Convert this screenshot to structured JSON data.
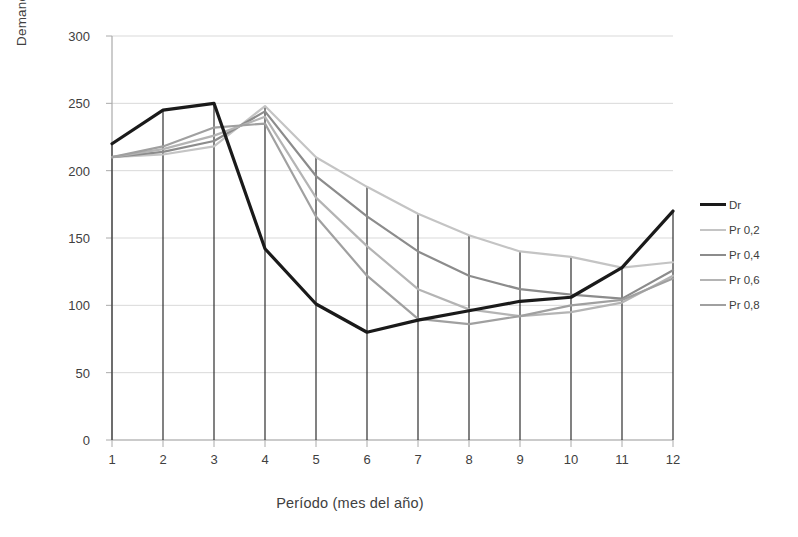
{
  "chart_data": {
    "type": "line",
    "title": "",
    "xlabel": "Período (mes del año)",
    "ylabel": "Demanda",
    "categories": [
      "1",
      "2",
      "3",
      "4",
      "5",
      "6",
      "7",
      "8",
      "9",
      "10",
      "11",
      "12"
    ],
    "x": [
      1,
      2,
      3,
      4,
      5,
      6,
      7,
      8,
      9,
      10,
      11,
      12
    ],
    "xlim": [
      1,
      12
    ],
    "ylim": [
      0,
      300
    ],
    "yticks": [
      "0",
      "50",
      "100",
      "150",
      "200",
      "250",
      "300"
    ],
    "ytick_values": [
      0,
      50,
      100,
      150,
      200,
      250,
      300
    ],
    "grid": "horizontal",
    "legend_position": "right",
    "drop_lines": true,
    "series": [
      {
        "name": "Dr",
        "color": "#1a1a1a",
        "width": 3.2,
        "values": [
          220,
          245,
          250,
          142,
          101,
          80,
          89,
          96,
          103,
          106,
          128,
          170
        ]
      },
      {
        "name": "Pr 0,2",
        "color": "#c4c4c4",
        "width": 2.2,
        "values": [
          210,
          212,
          218,
          248,
          210,
          188,
          168,
          152,
          140,
          136,
          128,
          132
        ]
      },
      {
        "name": "Pr 0,4",
        "color": "#8c8c8c",
        "width": 2.2,
        "values": [
          210,
          214,
          222,
          244,
          196,
          166,
          140,
          122,
          112,
          108,
          105,
          126
        ]
      },
      {
        "name": "Pr 0,6",
        "color": "#b4b4b4",
        "width": 2.2,
        "values": [
          210,
          216,
          226,
          240,
          180,
          144,
          112,
          97,
          92,
          95,
          102,
          122
        ]
      },
      {
        "name": "Pr 0,8",
        "color": "#a0a0a0",
        "width": 2.2,
        "values": [
          210,
          218,
          232,
          235,
          166,
          122,
          90,
          86,
          92,
          100,
          104,
          120
        ]
      }
    ]
  },
  "legend": {
    "items": [
      {
        "label": "Dr"
      },
      {
        "label": "Pr 0,2"
      },
      {
        "label": "Pr 0,4"
      },
      {
        "label": "Pr 0,6"
      },
      {
        "label": "Pr 0,8"
      }
    ]
  },
  "axes": {
    "y_title": "Demanda",
    "x_title": "Período (mes del año)"
  },
  "colors": {
    "grid": "#d9d9d9",
    "axis": "#aaaaaa",
    "drop_line": "#2e2e2e",
    "text": "#404040"
  }
}
